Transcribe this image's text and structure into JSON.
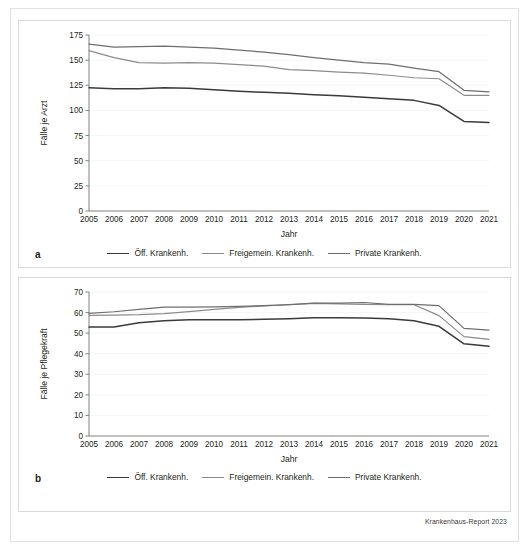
{
  "source_note": "Krankenhaus-Report 2023",
  "panels": [
    {
      "letter": "a",
      "id": "a"
    },
    {
      "letter": "b",
      "id": "b"
    }
  ],
  "legend": {
    "items": [
      {
        "label": "Öff. Krankenh.",
        "color": "#3a3a3a"
      },
      {
        "label": "Freigemein. Krankenh.",
        "color": "#8c8c8c"
      },
      {
        "label": "Private Krankenh.",
        "color": "#6e6e6e"
      }
    ]
  },
  "chart_data": [
    {
      "type": "line",
      "panel": "a",
      "title": "",
      "xlabel": "Jahr",
      "ylabel": "Fälle je Arzt",
      "ylim": [
        0,
        175
      ],
      "yticks": [
        0,
        25,
        50,
        75,
        100,
        125,
        150,
        175
      ],
      "grid": true,
      "legend_position": "bottom",
      "categories": [
        2005,
        2006,
        2007,
        2008,
        2009,
        2010,
        2011,
        2012,
        2013,
        2014,
        2015,
        2016,
        2017,
        2018,
        2019,
        2020,
        2021
      ],
      "series": [
        {
          "name": "Öff. Krankenh.",
          "color": "#3a3a3a",
          "values": [
            122.5,
            121.5,
            121.5,
            122.5,
            122.0,
            120.5,
            119.0,
            118.0,
            117.0,
            115.5,
            114.5,
            113.0,
            111.5,
            110.0,
            105.0,
            89.0,
            88.0
          ]
        },
        {
          "name": "Freigemein. Krankenh.",
          "color": "#8c8c8c",
          "values": [
            159.5,
            152.5,
            147.5,
            147.0,
            147.5,
            147.0,
            145.5,
            144.0,
            140.5,
            139.5,
            138.0,
            137.0,
            135.0,
            132.5,
            131.5,
            115.0,
            115.0
          ]
        },
        {
          "name": "Private Krankenh.",
          "color": "#6e6e6e",
          "values": [
            166.0,
            163.0,
            163.5,
            164.0,
            163.0,
            162.0,
            160.0,
            158.0,
            155.5,
            152.5,
            150.0,
            147.5,
            146.0,
            142.0,
            138.5,
            120.0,
            118.5
          ]
        }
      ]
    },
    {
      "type": "line",
      "panel": "b",
      "title": "",
      "xlabel": "Jahr",
      "ylabel": "Fälle je Pflegekraft",
      "ylim": [
        0,
        70
      ],
      "yticks": [
        0,
        10,
        20,
        30,
        40,
        50,
        60,
        70
      ],
      "grid": true,
      "legend_position": "bottom",
      "categories": [
        2005,
        2006,
        2007,
        2008,
        2009,
        2010,
        2011,
        2012,
        2013,
        2014,
        2015,
        2016,
        2017,
        2018,
        2019,
        2020,
        2021
      ],
      "series": [
        {
          "name": "Öff. Krankenh.",
          "color": "#3a3a3a",
          "values": [
            53.0,
            53.0,
            55.0,
            56.0,
            56.5,
            56.5,
            56.5,
            56.7,
            57.0,
            57.5,
            57.5,
            57.4,
            57.0,
            56.0,
            53.3,
            44.8,
            43.6
          ]
        },
        {
          "name": "Freigemein. Krankenh.",
          "color": "#8c8c8c",
          "values": [
            58.6,
            58.8,
            59.0,
            59.5,
            60.5,
            61.6,
            62.5,
            63.2,
            63.8,
            64.5,
            64.2,
            64.0,
            63.8,
            63.8,
            58.5,
            48.3,
            47.0
          ]
        },
        {
          "name": "Private Krankenh.",
          "color": "#6e6e6e",
          "values": [
            59.6,
            60.4,
            61.6,
            62.6,
            62.6,
            62.8,
            63.0,
            63.4,
            63.9,
            64.6,
            64.6,
            64.9,
            64.0,
            64.0,
            63.4,
            52.3,
            51.5
          ]
        }
      ]
    }
  ]
}
